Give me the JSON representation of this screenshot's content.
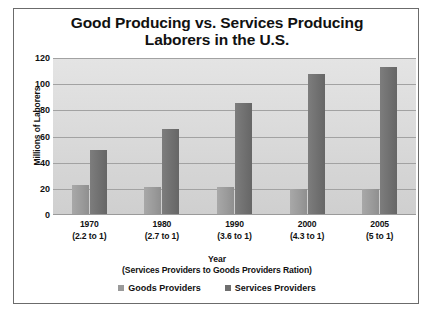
{
  "chart_data": {
    "type": "bar",
    "title": "Good Producing vs. Services Producing Laborers in the U.S.",
    "title_lines": [
      "Good Producing vs. Services Producing",
      "Laborers in the U.S."
    ],
    "categories": [
      "1970",
      "1980",
      "1990",
      "2000",
      "2005"
    ],
    "category_sublabels": [
      "(2.2 to 1)",
      "(2.7 to 1)",
      "(3.6 to 1)",
      "(4.3 to 1)",
      "(5 to 1)"
    ],
    "series": [
      {
        "name": "Goods Providers",
        "color": "#9a9a9a",
        "values": [
          22,
          21,
          21,
          19,
          19
        ]
      },
      {
        "name": "Services Providers",
        "color": "#6f6f6f",
        "values": [
          49,
          65,
          85,
          107,
          112
        ]
      }
    ],
    "xlabel": "Year",
    "xlabel_lines": [
      "Year",
      "(Services Providers to Goods Providers Ration)"
    ],
    "ylabel": "Millions of Laborers",
    "ylim": [
      0,
      120
    ],
    "y_ticks": [
      0,
      20,
      40,
      60,
      80,
      100,
      120
    ],
    "y_tick_labels": [
      "0",
      "20",
      "40",
      "60",
      "80",
      "100",
      "120"
    ],
    "grid": true,
    "legend_position": "bottom",
    "plot_background": "#d8d8d8",
    "gridline_color": "#a2a2a2",
    "border_color": "#6b6b6b"
  }
}
